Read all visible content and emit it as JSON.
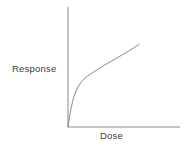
{
  "chart_data": {
    "type": "line",
    "title": "",
    "xlabel": "Dose",
    "ylabel": "Response",
    "x_ticks": [],
    "y_ticks": [],
    "grid": false,
    "legend": false,
    "axis_color": "#8a8a8a",
    "curve_color": "#8a8a8a",
    "text_color": "#3b3b3b",
    "series": [
      {
        "name": "response-curve",
        "points": [
          [
            0.0,
            0.0
          ],
          [
            0.009,
            0.058
          ],
          [
            0.018,
            0.108
          ],
          [
            0.027,
            0.154
          ],
          [
            0.04,
            0.208
          ],
          [
            0.054,
            0.254
          ],
          [
            0.071,
            0.3
          ],
          [
            0.094,
            0.342
          ],
          [
            0.121,
            0.379
          ],
          [
            0.152,
            0.408
          ],
          [
            0.188,
            0.433
          ],
          [
            0.228,
            0.458
          ],
          [
            0.272,
            0.483
          ],
          [
            0.321,
            0.513
          ],
          [
            0.375,
            0.542
          ],
          [
            0.429,
            0.571
          ],
          [
            0.482,
            0.6
          ],
          [
            0.536,
            0.629
          ],
          [
            0.585,
            0.658
          ],
          [
            0.634,
            0.688
          ]
        ]
      }
    ]
  }
}
